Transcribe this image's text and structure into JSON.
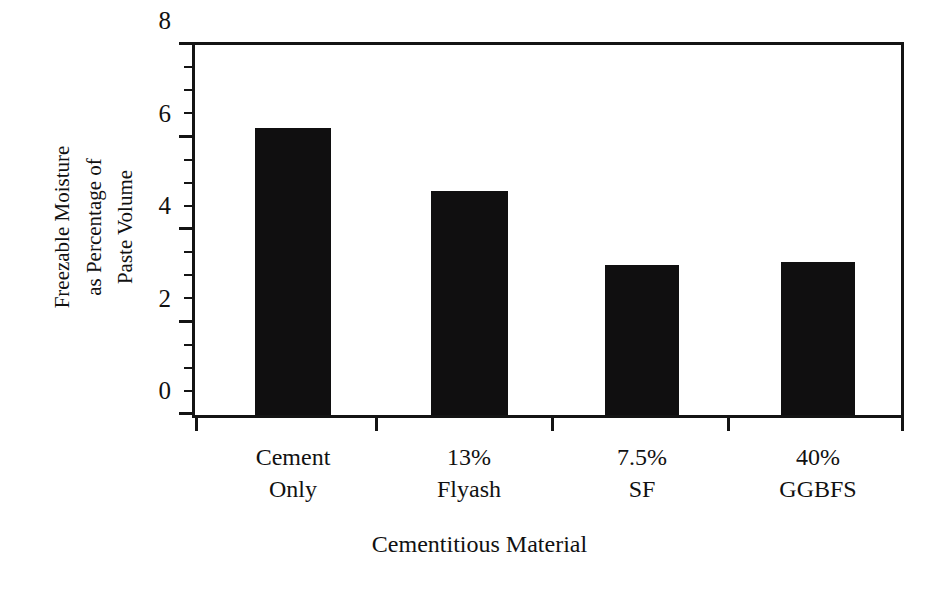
{
  "chart_data": {
    "type": "bar",
    "title": "",
    "categories": [
      "Cement Only",
      "13% Flyash",
      "7.5% SF",
      "40% GGBFS"
    ],
    "category_lines": [
      [
        "Cement",
        "Only"
      ],
      [
        "13%",
        "Flyash"
      ],
      [
        "7.5%",
        "SF"
      ],
      [
        "40%",
        "GGBFS"
      ]
    ],
    "values": [
      6.2,
      4.85,
      3.25,
      3.3
    ],
    "xlabel": "Cementitious Material",
    "ylabel": "Freezable Moisture as Percentage of Paste Volume",
    "ylabel_lines": [
      "Freezable Moisture",
      "as Percentage of",
      "Paste Volume"
    ],
    "ylim": [
      0,
      8
    ],
    "ytick_labels": [
      "0",
      "2",
      "4",
      "6",
      "8"
    ],
    "ytick_values": [
      0,
      2,
      4,
      6,
      8
    ],
    "yminor_values": [
      0.5,
      1,
      1.5,
      2.5,
      3,
      3.5,
      4.5,
      5,
      5.5,
      6.5,
      7,
      7.5
    ],
    "grid": false,
    "legend": null,
    "bar_color": "#100f10",
    "axis_color": "#141414",
    "background": "#ffffff"
  }
}
